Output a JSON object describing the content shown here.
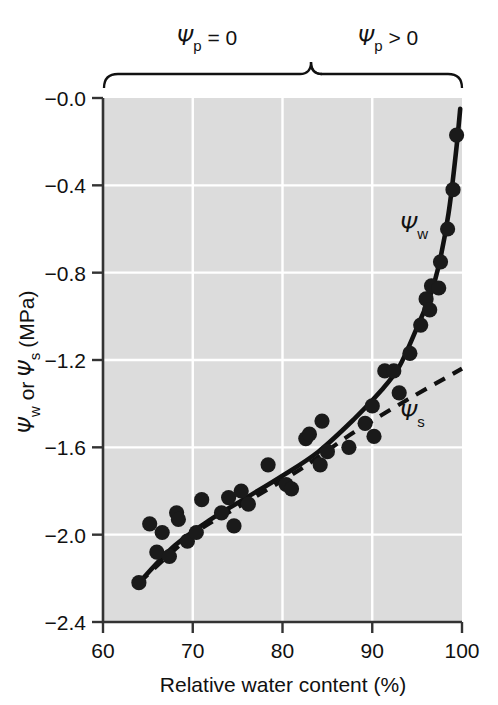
{
  "chart_data": {
    "type": "scatter",
    "title": "",
    "xlabel": "Relative water content (%)",
    "ylabel": "Ψw or Ψs (MPa)",
    "ylabel_parts": {
      "psi1": "Ψ",
      "sub1": "w",
      "mid": " or ",
      "psi2": "Ψ",
      "sub2": "s",
      "unit": " (MPa)"
    },
    "xlim": [
      60,
      100
    ],
    "ylim": [
      -2.4,
      0.0
    ],
    "xticks": [
      60,
      70,
      80,
      90,
      100
    ],
    "xtick_labels": [
      "60",
      "70",
      "80",
      "90",
      "100"
    ],
    "yticks": [
      0.0,
      -0.4,
      -0.8,
      -1.2,
      -1.6,
      -2.0,
      -2.4
    ],
    "ytick_labels": [
      "−0.0",
      "−0.4",
      "−0.8",
      "−1.2",
      "−1.6",
      "−2.0",
      "−2.4"
    ],
    "grid": true,
    "grid_color": "#ffffff",
    "plot_background": "#dcdcdc",
    "legend_position": "inline-annotations",
    "points": [
      {
        "x": 64.0,
        "y": -2.22
      },
      {
        "x": 65.2,
        "y": -1.95
      },
      {
        "x": 66.0,
        "y": -2.08
      },
      {
        "x": 66.6,
        "y": -1.99
      },
      {
        "x": 67.4,
        "y": -2.1
      },
      {
        "x": 68.2,
        "y": -1.9
      },
      {
        "x": 68.4,
        "y": -1.93
      },
      {
        "x": 69.4,
        "y": -2.03
      },
      {
        "x": 70.4,
        "y": -1.99
      },
      {
        "x": 71.0,
        "y": -1.84
      },
      {
        "x": 73.2,
        "y": -1.9
      },
      {
        "x": 74.0,
        "y": -1.83
      },
      {
        "x": 74.6,
        "y": -1.96
      },
      {
        "x": 75.4,
        "y": -1.8
      },
      {
        "x": 76.2,
        "y": -1.86
      },
      {
        "x": 78.4,
        "y": -1.68
      },
      {
        "x": 80.4,
        "y": -1.77
      },
      {
        "x": 81.0,
        "y": -1.79
      },
      {
        "x": 82.6,
        "y": -1.56
      },
      {
        "x": 83.0,
        "y": -1.54
      },
      {
        "x": 84.2,
        "y": -1.68
      },
      {
        "x": 84.4,
        "y": -1.48
      },
      {
        "x": 85.0,
        "y": -1.62
      },
      {
        "x": 87.4,
        "y": -1.6
      },
      {
        "x": 89.2,
        "y": -1.49
      },
      {
        "x": 90.0,
        "y": -1.41
      },
      {
        "x": 90.2,
        "y": -1.55
      },
      {
        "x": 91.4,
        "y": -1.25
      },
      {
        "x": 92.4,
        "y": -1.25
      },
      {
        "x": 93.0,
        "y": -1.35
      },
      {
        "x": 94.2,
        "y": -1.17
      },
      {
        "x": 95.4,
        "y": -1.04
      },
      {
        "x": 96.0,
        "y": -0.92
      },
      {
        "x": 96.4,
        "y": -0.97
      },
      {
        "x": 96.6,
        "y": -0.86
      },
      {
        "x": 97.4,
        "y": -0.87
      },
      {
        "x": 97.6,
        "y": -0.75
      },
      {
        "x": 98.4,
        "y": -0.6
      },
      {
        "x": 99.0,
        "y": -0.42
      },
      {
        "x": 99.4,
        "y": -0.17
      }
    ],
    "series": [
      {
        "name": "Ψw",
        "label": "Ψw",
        "style": "solid",
        "color": "#111111",
        "x": [
          64.0,
          68.0,
          72.0,
          76.0,
          80.0,
          84.0,
          88.0,
          91.0,
          93.0,
          95.0,
          96.5,
          97.5,
          98.5,
          99.3,
          99.8
        ],
        "y": [
          -2.22,
          -2.05,
          -1.93,
          -1.83,
          -1.73,
          -1.62,
          -1.47,
          -1.34,
          -1.23,
          -1.05,
          -0.9,
          -0.75,
          -0.53,
          -0.26,
          -0.05
        ]
      },
      {
        "name": "Ψs",
        "label": "Ψs",
        "style": "dashed",
        "color": "#111111",
        "x": [
          64.0,
          70.0,
          76.0,
          82.0,
          88.0,
          94.0,
          100.0
        ],
        "y": [
          -2.22,
          -2.0,
          -1.85,
          -1.7,
          -1.53,
          -1.38,
          -1.24
        ]
      }
    ],
    "annotations": [
      {
        "id": "psi-p-equals-zero",
        "text": "Ψp = 0",
        "x_range": [
          60,
          84
        ],
        "position": "top"
      },
      {
        "id": "psi-p-greater-zero",
        "text": "Ψp > 0",
        "x_range": [
          84,
          100
        ],
        "position": "top"
      },
      {
        "id": "psi-w-curve-label",
        "text": "Ψw",
        "x": 95.0,
        "y": -0.7
      },
      {
        "id": "psi-s-curve-label",
        "text": "Ψs",
        "x": 95.0,
        "y": -1.42
      }
    ]
  },
  "labels": {
    "brace_left": {
      "psi": "Ψ",
      "sub": "p",
      "rel": "= 0"
    },
    "brace_right": {
      "psi": "Ψ",
      "sub": "p",
      "rel": "> 0"
    },
    "curve_w": {
      "psi": "Ψ",
      "sub": "w"
    },
    "curve_s": {
      "psi": "Ψ",
      "sub": "s"
    },
    "x_axis_title": "Relative water content (%)",
    "y_axis": {
      "psi1": "Ψ",
      "sub1": "w",
      "mid": "or",
      "psi2": "Ψ",
      "sub2": "s",
      "unit": "(MPa)"
    }
  }
}
